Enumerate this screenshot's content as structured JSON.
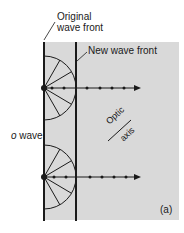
{
  "labels": {
    "original_line1": "Original",
    "original_line2": "wave front",
    "new_wave_front": "New wave front",
    "o_wave_italic": "o",
    "o_wave_rest": " wave",
    "optic": "Optic",
    "axis": "axis",
    "panel": "(a)"
  },
  "colors": {
    "medium": "#d9d9d9",
    "ink": "#1a1a1a"
  }
}
